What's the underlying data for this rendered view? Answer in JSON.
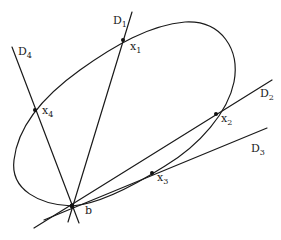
{
  "diagram": {
    "stroke_color": "#1a1a1a",
    "ellipse": {
      "label": ""
    },
    "base_point": {
      "label": "b",
      "x": 72,
      "y": 206
    },
    "lines": [
      {
        "id": "D1",
        "name": "D",
        "sub": "1",
        "end": [
          132,
          12
        ],
        "back": [
          68,
          222
        ]
      },
      {
        "id": "D2",
        "name": "D",
        "sub": "2",
        "end": [
          272,
          80
        ],
        "back": [
          34,
          228
        ]
      },
      {
        "id": "D3",
        "name": "D",
        "sub": "3",
        "end": [
          267,
          128
        ],
        "back": [
          44,
          220
        ]
      },
      {
        "id": "D4",
        "name": "D",
        "sub": "4",
        "end": [
          12,
          47
        ],
        "back": [
          79,
          223
        ]
      }
    ],
    "points": [
      {
        "id": "x1",
        "name": "x",
        "sub": "1",
        "x": 123,
        "y": 40
      },
      {
        "id": "x2",
        "name": "x",
        "sub": "2",
        "x": 216,
        "y": 114
      },
      {
        "id": "x3",
        "name": "x",
        "sub": "3",
        "x": 152,
        "y": 173
      },
      {
        "id": "x4",
        "name": "x",
        "sub": "4",
        "x": 35,
        "y": 110
      }
    ]
  },
  "labels": {
    "D1": "D",
    "D1_sub": "1",
    "D2": "D",
    "D2_sub": "2",
    "D3": "D",
    "D3_sub": "3",
    "D4": "D",
    "D4_sub": "4",
    "x1": "x",
    "x1_sub": "1",
    "x2": "x",
    "x2_sub": "2",
    "x3": "x",
    "x3_sub": "3",
    "x4": "x",
    "x4_sub": "4",
    "b": "b"
  }
}
